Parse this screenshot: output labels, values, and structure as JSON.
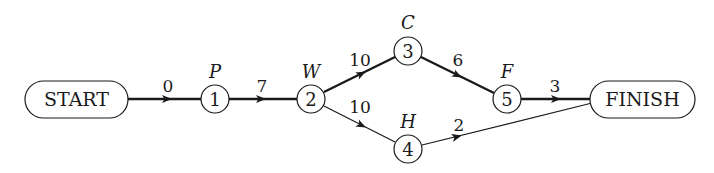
{
  "diagram": {
    "type": "pert-network",
    "colors": {
      "stroke": "#1a1a1a",
      "background": "#ffffff"
    },
    "terminals": {
      "start": {
        "label": "START"
      },
      "finish": {
        "label": "FINISH"
      }
    },
    "nodes": [
      {
        "id": "1",
        "number": "1",
        "activity": "P"
      },
      {
        "id": "2",
        "number": "2",
        "activity": "W"
      },
      {
        "id": "3",
        "number": "3",
        "activity": "C"
      },
      {
        "id": "4",
        "number": "4",
        "activity": "H"
      },
      {
        "id": "5",
        "number": "5",
        "activity": "F"
      }
    ],
    "edges": [
      {
        "from": "START",
        "to": "1",
        "duration": "0",
        "critical": true
      },
      {
        "from": "1",
        "to": "2",
        "duration": "7",
        "critical": true
      },
      {
        "from": "2",
        "to": "3",
        "duration": "10",
        "critical": true
      },
      {
        "from": "2",
        "to": "4",
        "duration": "10",
        "critical": false
      },
      {
        "from": "3",
        "to": "5",
        "duration": "6",
        "critical": true
      },
      {
        "from": "5",
        "to": "FINISH",
        "duration": "3",
        "critical": true
      },
      {
        "from": "4",
        "to": "FINISH",
        "duration": "2",
        "critical": false
      }
    ]
  }
}
